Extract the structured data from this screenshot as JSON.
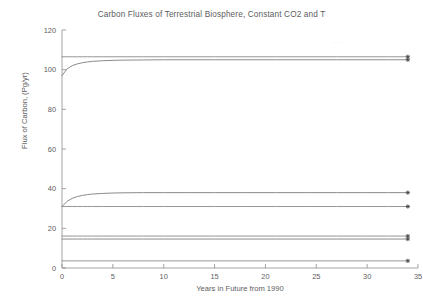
{
  "chart_data": {
    "type": "line",
    "title": "Carbon Fluxes of Terrestrial Biosphere, Constant CO2 and T",
    "xlabel": "Years in Future from 1990",
    "ylabel": "Flux of Carbon, (Pg/yr)",
    "xlim": [
      0,
      35
    ],
    "ylim": [
      0,
      120
    ],
    "xticks": [
      0,
      5,
      10,
      15,
      20,
      25,
      30,
      35
    ],
    "yticks": [
      0,
      20,
      40,
      60,
      80,
      100,
      120
    ],
    "xtick_labels": [
      "0",
      "5",
      "10",
      "15",
      "20",
      "25",
      "30",
      "35"
    ],
    "ytick_labels": [
      "0",
      "20",
      "40",
      "60",
      "80",
      "100",
      "120"
    ],
    "grid": false,
    "legend": "none",
    "marker_symbol": "*",
    "marker_x": 34,
    "x": [
      0,
      0.5,
      1,
      1.5,
      2,
      2.5,
      3,
      4,
      5,
      6,
      8,
      10,
      12,
      15,
      18,
      21,
      24,
      27,
      30,
      32,
      34
    ],
    "series": [
      {
        "name": "gpp-constant",
        "color": "#8a8a8d",
        "values": [
          106.5,
          106.5,
          106.5,
          106.5,
          106.5,
          106.5,
          106.5,
          106.5,
          106.5,
          106.5,
          106.5,
          106.5,
          106.5,
          106.5,
          106.5,
          106.5,
          106.5,
          106.5,
          106.5,
          106.5,
          106.5
        ],
        "endpoint": 106.5
      },
      {
        "name": "total-respiration",
        "color": "#7d7d80",
        "values": [
          97.0,
          100.4,
          102.0,
          102.9,
          103.5,
          103.9,
          104.2,
          104.5,
          104.7,
          104.8,
          104.9,
          105.0,
          105.0,
          105.0,
          105.0,
          105.0,
          105.0,
          105.0,
          105.0,
          105.0,
          105.0
        ],
        "endpoint": 105.0
      },
      {
        "name": "heterotrophic-respiration",
        "color": "#7d7d80",
        "values": [
          31.0,
          33.6,
          35.1,
          36.0,
          36.6,
          37.0,
          37.3,
          37.6,
          37.8,
          37.9,
          38.0,
          38.0,
          38.0,
          38.0,
          38.0,
          38.0,
          38.0,
          38.0,
          38.0,
          38.0,
          38.0
        ],
        "endpoint": 38.0
      },
      {
        "name": "npp-constant",
        "color": "#8a8a8d",
        "values": [
          31.0,
          31.0,
          31.0,
          31.0,
          31.0,
          31.0,
          31.0,
          31.0,
          31.0,
          31.0,
          31.0,
          31.0,
          31.0,
          31.0,
          31.0,
          31.0,
          31.0,
          31.0,
          31.0,
          31.0,
          31.0
        ],
        "endpoint": 31.0
      },
      {
        "name": "litter-flux",
        "color": "#8a8a8d",
        "values": [
          16.1,
          16.1,
          16.1,
          16.1,
          16.1,
          16.1,
          16.1,
          16.1,
          16.1,
          16.1,
          16.1,
          16.1,
          16.1,
          16.1,
          16.1,
          16.1,
          16.1,
          16.1,
          16.1,
          16.1,
          16.1
        ],
        "endpoint": 16.1
      },
      {
        "name": "soil-carbon-flux",
        "color": "#7d7d80",
        "values": [
          14.6,
          14.6,
          14.6,
          14.6,
          14.6,
          14.6,
          14.6,
          14.6,
          14.6,
          14.6,
          14.6,
          14.6,
          14.6,
          14.6,
          14.6,
          14.6,
          14.6,
          14.6,
          14.6,
          14.6,
          14.6
        ],
        "endpoint": 14.6
      },
      {
        "name": "residual-flux",
        "color": "#8a8a8d",
        "values": [
          3.6,
          3.6,
          3.6,
          3.6,
          3.6,
          3.6,
          3.6,
          3.6,
          3.6,
          3.6,
          3.6,
          3.6,
          3.6,
          3.6,
          3.6,
          3.6,
          3.6,
          3.6,
          3.6,
          3.6,
          3.6
        ],
        "endpoint": 3.6
      }
    ]
  },
  "artifact": {
    "faint_text": "....."
  }
}
